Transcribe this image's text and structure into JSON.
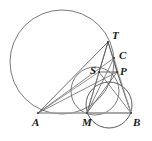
{
  "figure": {
    "width": 152,
    "height": 141,
    "background_color": "#ffffff",
    "stroke_color": "#3a3a3a",
    "light_stroke_color": "#9a9a9a",
    "label_color": "#1a1a1a"
  },
  "points": [
    {
      "name": "T",
      "label": "T",
      "x": 108,
      "y": 42,
      "label_x": 112,
      "label_y": 30
    },
    {
      "name": "C",
      "label": "C",
      "x": 114,
      "y": 58,
      "label_x": 119,
      "label_y": 50
    },
    {
      "name": "S",
      "label": "S",
      "x": 99,
      "y": 72,
      "label_x": 90,
      "label_y": 65
    },
    {
      "name": "P",
      "label": "P",
      "x": 117,
      "y": 72,
      "label_x": 120,
      "label_y": 66
    },
    {
      "name": "A",
      "label": "A",
      "x": 38,
      "y": 113,
      "label_x": 32,
      "label_y": 117
    },
    {
      "name": "M",
      "label": "M",
      "x": 87,
      "y": 113,
      "label_x": 82,
      "label_y": 117
    },
    {
      "name": "B",
      "label": "B",
      "x": 131,
      "y": 113,
      "label_x": 133,
      "label_y": 117
    }
  ],
  "circles": [
    {
      "name": "large-circle",
      "cx": 62,
      "cy": 62,
      "r": 52,
      "stroke": "#6a6a6a",
      "width": 0.9
    },
    {
      "name": "small-circle",
      "cx": 109,
      "cy": 105,
      "r": 23,
      "stroke": "#4a4a4a",
      "width": 0.9
    },
    {
      "name": "mid-circle",
      "cx": 95,
      "cy": 91,
      "r": 24,
      "stroke": "#5a5a5a",
      "width": 0.8
    }
  ],
  "segments": [
    {
      "name": "segment-A-B",
      "from": "A",
      "to": "B",
      "stroke": "#9a9a9a",
      "width": 1.4
    },
    {
      "name": "segment-A-T",
      "from": "A",
      "to": "T",
      "stroke": "#4a4a4a",
      "width": 0.8
    },
    {
      "name": "segment-A-C",
      "from": "A",
      "to": "C",
      "stroke": "#6a6a6a",
      "width": 0.8
    },
    {
      "name": "segment-A-P",
      "from": "A",
      "to": "P",
      "stroke": "#6a6a6a",
      "width": 0.8
    },
    {
      "name": "segment-A-S",
      "from": "A",
      "to": "S",
      "stroke": "#7a7a7a",
      "width": 0.8
    },
    {
      "name": "segment-T-M",
      "from": "T",
      "to": "M",
      "stroke": "#4a4a4a",
      "width": 0.8
    },
    {
      "name": "segment-T-B",
      "from": "T",
      "to": "B",
      "stroke": "#5a5a5a",
      "width": 0.8
    },
    {
      "name": "segment-T-S",
      "from": "T",
      "to": "S",
      "stroke": "#5a5a5a",
      "width": 0.8
    },
    {
      "name": "segment-T-P",
      "from": "T",
      "to": "P",
      "stroke": "#5a5a5a",
      "width": 0.8
    },
    {
      "name": "segment-S-P",
      "from": "S",
      "to": "P",
      "stroke": "#4a4a4a",
      "width": 0.8
    },
    {
      "name": "segment-S-B",
      "from": "S",
      "to": "B",
      "stroke": "#6a6a6a",
      "width": 0.8
    },
    {
      "name": "segment-M-P",
      "from": "M",
      "to": "P",
      "stroke": "#5a5a5a",
      "width": 0.8
    },
    {
      "name": "segment-M-C",
      "from": "M",
      "to": "C",
      "stroke": "#6a6a6a",
      "width": 0.8
    },
    {
      "name": "segment-M-B",
      "from": "M",
      "to": "B",
      "stroke": "#9a9a9a",
      "width": 1.0
    },
    {
      "name": "segment-P-B",
      "from": "P",
      "to": "B",
      "stroke": "#4a4a4a",
      "width": 0.8
    },
    {
      "name": "segment-C-P",
      "from": "C",
      "to": "P",
      "stroke": "#4a4a4a",
      "width": 0.8
    },
    {
      "name": "segment-C-B",
      "from": "C",
      "to": "B",
      "stroke": "#b0b0b0",
      "width": 0.8
    },
    {
      "name": "segment-S-M",
      "from": "S",
      "to": "M",
      "stroke": "#7a7a7a",
      "width": 0.8
    }
  ]
}
